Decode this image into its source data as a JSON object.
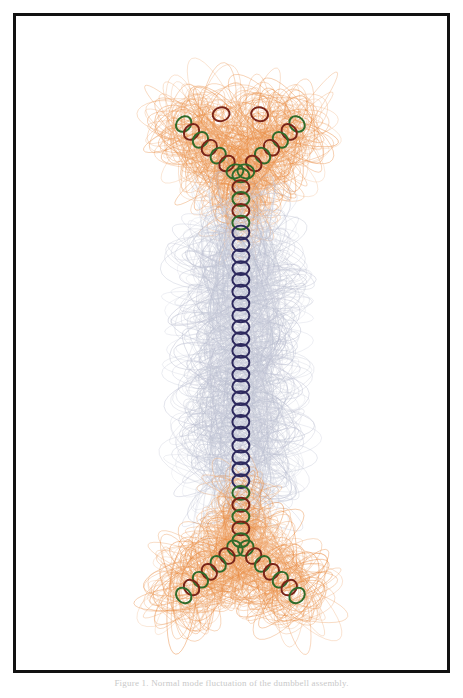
{
  "page": {
    "background_color": "#ffffff",
    "width": 463,
    "height": 698
  },
  "frame": {
    "border_color": "#111111",
    "border_width": 3,
    "fill_color": "#ffffff"
  },
  "caption": {
    "text": "Figure 1. Normal mode fluctuation of the dumbbell assembly."
  },
  "figure": {
    "title": "",
    "palette": {
      "trace_high": "#e8883c",
      "trace_high_soft": "#f0a878",
      "trace_mid": "#9aa6b8",
      "trace_low": "#b8bcce",
      "trace_teal": "#8fb3ae",
      "ring_green": "#2f6b2a",
      "ring_maroon": "#7a2418",
      "ring_navy": "#2e2a5e",
      "ring_teal": "#3f7a6e"
    },
    "ring_outline_width": 2.0,
    "trace_outline_width": 0.55
  },
  "chart_data": {
    "type": "scatter",
    "title": "",
    "subtitle": "",
    "xlabel": "",
    "ylabel": "",
    "xlim": [
      0,
      437
    ],
    "ylim": [
      0,
      660
    ],
    "grid": false,
    "legend": null,
    "series": [
      {
        "name": "top-junction-left-arm",
        "ring_color": "#2f6b2a",
        "alt_ring_color": "#7a2418",
        "trace_color": "#e8883c",
        "amplitude": 46,
        "x": [
          170,
          178,
          187,
          196,
          205,
          214,
          222,
          208
        ],
        "y": [
          108,
          116,
          124,
          132,
          140,
          148,
          156,
          98
        ]
      },
      {
        "name": "top-junction-right-arm",
        "ring_color": "#2f6b2a",
        "alt_ring_color": "#7a2418",
        "trace_color": "#e8883c",
        "amplitude": 46,
        "x": [
          285,
          277,
          268,
          259,
          250,
          241,
          233,
          247
        ],
        "y": [
          108,
          116,
          124,
          132,
          140,
          148,
          156,
          98
        ]
      },
      {
        "name": "top-junction-stem",
        "ring_color": "#2f6b2a",
        "alt_ring_color": "#7a2418",
        "trace_color": "#e8883c",
        "amplitude": 34,
        "x": [
          228,
          228,
          228,
          228,
          228
        ],
        "y": [
          160,
          172,
          184,
          196,
          208
        ]
      },
      {
        "name": "central-shaft",
        "ring_color": "#2e2a5e",
        "trace_color": "#b8bcce",
        "amplitude": 60,
        "x": [
          228,
          228,
          228,
          228,
          228,
          228,
          228,
          228,
          228,
          228,
          228,
          228,
          228,
          228,
          228,
          228,
          228,
          228,
          228,
          228,
          228,
          228
        ],
        "y": [
          218,
          230,
          242,
          254,
          266,
          278,
          290,
          302,
          314,
          326,
          338,
          350,
          362,
          374,
          386,
          398,
          410,
          422,
          434,
          446,
          458,
          470
        ]
      },
      {
        "name": "bottom-junction-stem",
        "ring_color": "#2f6b2a",
        "alt_ring_color": "#7a2418",
        "trace_color": "#e8883c",
        "amplitude": 34,
        "x": [
          228,
          228,
          228,
          228,
          228
        ],
        "y": [
          482,
          494,
          506,
          518,
          530
        ]
      },
      {
        "name": "bottom-junction-left-arm",
        "ring_color": "#2f6b2a",
        "alt_ring_color": "#7a2418",
        "trace_color": "#e8883c",
        "amplitude": 48,
        "x": [
          222,
          214,
          205,
          196,
          187,
          178,
          170
        ],
        "y": [
          538,
          546,
          554,
          562,
          570,
          578,
          586
        ]
      },
      {
        "name": "bottom-junction-right-arm",
        "ring_color": "#2f6b2a",
        "alt_ring_color": "#7a2418",
        "trace_color": "#e8883c",
        "amplitude": 48,
        "x": [
          233,
          241,
          250,
          259,
          268,
          277,
          285
        ],
        "y": [
          538,
          546,
          554,
          562,
          570,
          578,
          586
        ]
      }
    ]
  }
}
